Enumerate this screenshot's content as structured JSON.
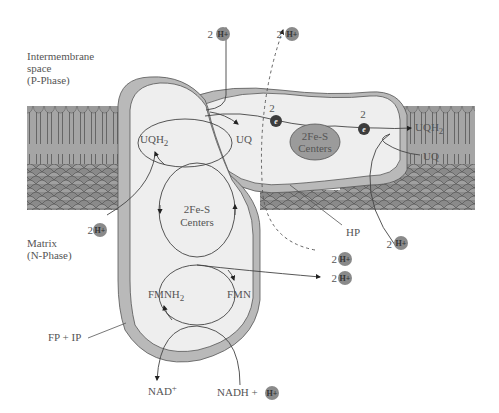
{
  "regions": {
    "intermembrane": [
      "Intermembrane",
      "space",
      "(P-Phase)"
    ],
    "matrix": [
      "Matrix",
      "(N-Phase)"
    ]
  },
  "labels": {
    "uqh2_left": "UQH",
    "uqh2_left_sub": "2",
    "uq_left": "UQ",
    "fes_upper": "2Fe-S",
    "fes_upper2": "Centers",
    "fes_lower": "2Fe-S",
    "fes_lower2": "Centers",
    "fmnh2": "FMNH",
    "fmnh2_sub": "2",
    "fmn": "FMN",
    "uqh2_right": "UQH",
    "uqh2_right_sub": "2",
    "uq_right": "UQ",
    "hp": "HP",
    "fp_ip": "FP + IP",
    "nad": "NAD",
    "nad_sup": "+",
    "nadh": "NADH +"
  },
  "electrons": [
    {
      "count": "2",
      "symbol": "e"
    },
    {
      "count": "2",
      "symbol": "e"
    }
  ],
  "protons": [
    {
      "id": "top-left",
      "count": "2",
      "symbol": "H+"
    },
    {
      "id": "top-dashed",
      "count": "2",
      "symbol": "H+"
    },
    {
      "id": "matrix-left",
      "count": "2",
      "symbol": "H+"
    },
    {
      "id": "right-hp",
      "count": "2",
      "symbol": "H+"
    },
    {
      "id": "dashed-out",
      "count": "2",
      "symbol": "H+"
    },
    {
      "id": "fmn-out",
      "count": "2",
      "symbol": "H+"
    },
    {
      "id": "nadh",
      "count": "",
      "symbol": "H+"
    }
  ],
  "colors": {
    "membrane": "#9a9a9a",
    "membrane_dark": "#6e6e6e",
    "complex_fill": "#eeeeee",
    "complex_rim": "#b9b9b9",
    "fes_fill": "#9b9b9b",
    "proton": "#8a8a8a",
    "electron": "#3c3c3c",
    "line": "#444444"
  }
}
